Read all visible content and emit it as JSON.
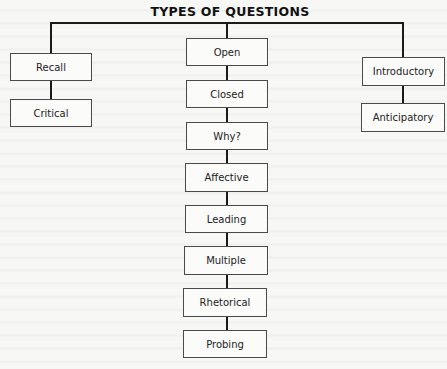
{
  "diagram": {
    "title": "TYPES OF QUESTIONS",
    "type": "tree",
    "branches": [
      {
        "name": "left",
        "nodes": [
          "Recall",
          "Critical"
        ]
      },
      {
        "name": "center",
        "nodes": [
          "Open",
          "Closed",
          "Why?",
          "Affective",
          "Leading",
          "Multiple",
          "Rhetorical",
          "Probing"
        ]
      },
      {
        "name": "right",
        "nodes": [
          "Introductory",
          "Anticipatory"
        ]
      }
    ]
  }
}
